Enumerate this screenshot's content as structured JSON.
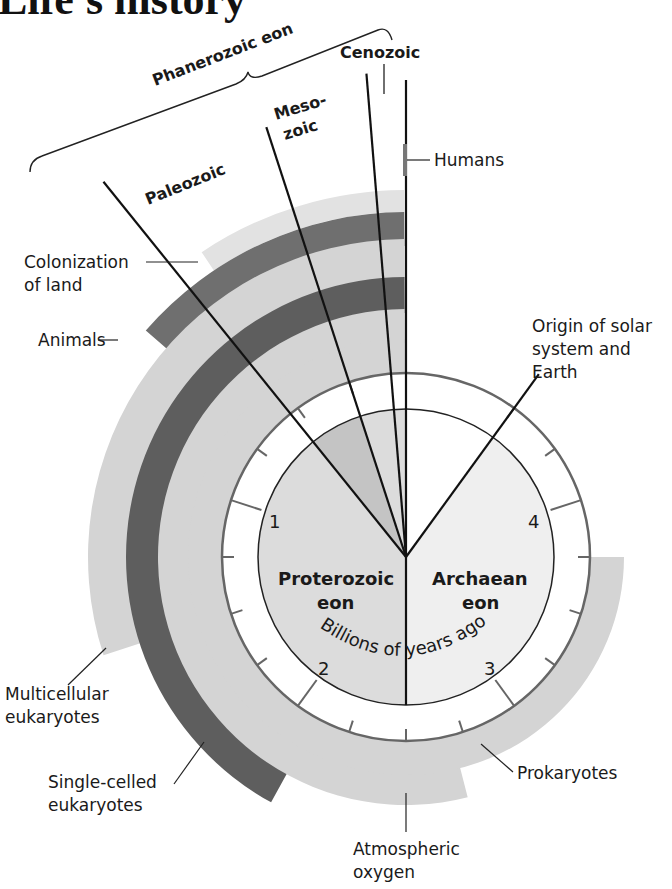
{
  "title": "Life's history",
  "chart_data": {
    "type": "diagram",
    "title": "Life's history",
    "center_label": "Billions of years ago",
    "scale_ticks": [
      "1",
      "2",
      "3",
      "4"
    ],
    "eons": [
      {
        "name": "Proterozoic eon",
        "start_bya": 2.5,
        "end_bya": 0.54
      },
      {
        "name": "Archaean eon",
        "start_bya": 4.5,
        "end_bya": 2.5
      },
      {
        "name": "Phanerozoic eon",
        "start_bya": 0.54,
        "end_bya": 0
      }
    ],
    "eras": [
      {
        "name": "Paleozoic",
        "start_bya": 0.54,
        "end_bya": 0.25
      },
      {
        "name": "Mesozoic",
        "start_bya": 0.25,
        "end_bya": 0.065
      },
      {
        "name": "Cenozoic",
        "start_bya": 0.065,
        "end_bya": 0
      }
    ],
    "bands": [
      {
        "name": "Humans",
        "start_bya": 0.0002
      },
      {
        "name": "Colonization of land",
        "start_bya": 0.47
      },
      {
        "name": "Animals",
        "start_bya": 0.68
      },
      {
        "name": "Multicellular eukaryotes",
        "start_bya": 1.5
      },
      {
        "name": "Single-celled eukaryotes",
        "start_bya": 2.1
      },
      {
        "name": "Atmospheric oxygen",
        "start_bya": 2.7
      },
      {
        "name": "Prokaryotes",
        "start_bya": 3.75
      }
    ],
    "events": [
      {
        "name": "Origin of solar system and Earth",
        "bya": 4.5
      }
    ]
  },
  "labels": {
    "phanerozoic": "Phanerozoic eon",
    "cenozoic": "Cenozoic",
    "mesozoic_1": "Meso-",
    "mesozoic_2": "zoic",
    "paleozoic": "Paleozoic",
    "humans": "Humans",
    "colonization_1": "Colonization",
    "colonization_2": "of land",
    "animals": "Animals",
    "origin_1": "Origin of solar",
    "origin_2": "system and",
    "origin_3": "Earth",
    "multicellular_1": "Multicellular",
    "multicellular_2": "eukaryotes",
    "single_1": "Single-celled",
    "single_2": "eukaryotes",
    "prokaryotes": "Prokaryotes",
    "oxygen_1": "Atmospheric",
    "oxygen_2": "oxygen",
    "proterozoic_1": "Proterozoic",
    "proterozoic_2": "eon",
    "archaean_1": "Archaean",
    "archaean_2": "eon",
    "billions": "Billions of years ago",
    "tick_1": "1",
    "tick_2": "2",
    "tick_3": "3",
    "tick_4": "4"
  },
  "colors": {
    "light_band": "#d4d4d4",
    "lighter_band": "#e2e2e2",
    "dark_band": "#5e5e5e",
    "medium_dark_band": "#6f6f6f",
    "proterozoic_fill": "#dcdcdc",
    "archaean_fill": "#efefef",
    "paleozoic_wedge": "#c4c4c4"
  }
}
